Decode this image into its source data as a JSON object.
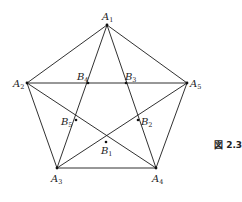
{
  "figure": {
    "caption": "図 2.3",
    "vertices": {
      "A1": {
        "name": "A",
        "sub": "1",
        "x": 107,
        "y": 25
      },
      "A2": {
        "name": "A",
        "sub": "2",
        "x": 27,
        "y": 83
      },
      "A3": {
        "name": "A",
        "sub": "3",
        "x": 57,
        "y": 168
      },
      "A4": {
        "name": "A",
        "sub": "4",
        "x": 156,
        "y": 168
      },
      "A5": {
        "name": "A",
        "sub": "5",
        "x": 187,
        "y": 83
      }
    },
    "intersections": {
      "B1": {
        "name": "B",
        "sub": "1",
        "x": 106,
        "y": 142
      },
      "B2": {
        "name": "B",
        "sub": "2",
        "x": 138,
        "y": 120
      },
      "B3": {
        "name": "B",
        "sub": "3",
        "x": 126,
        "y": 83
      },
      "B4": {
        "name": "B",
        "sub": "4",
        "x": 88,
        "y": 83
      },
      "B5": {
        "name": "B",
        "sub": "5",
        "x": 76,
        "y": 120
      }
    }
  }
}
